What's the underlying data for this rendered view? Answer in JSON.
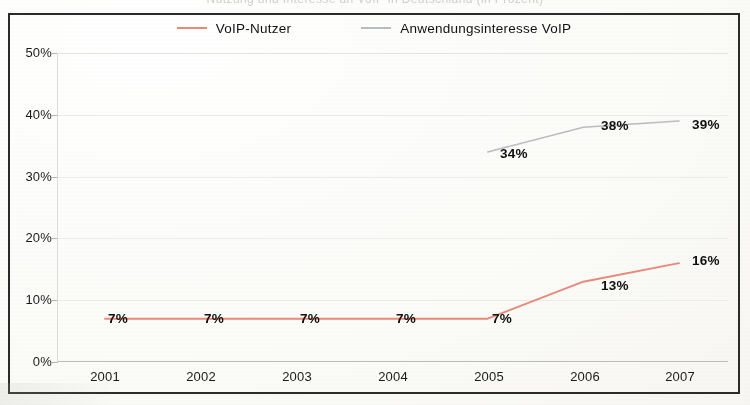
{
  "title_partial": "Nutzung und Interesse an VoIP in Deutschland (in Prozent)",
  "legend": {
    "items": [
      {
        "label": "VoIP-Nutzer",
        "color": "#e9897a"
      },
      {
        "label": "Anwendungsinteresse VoIP",
        "color": "#b9bcc0"
      }
    ]
  },
  "axes": {
    "y_ticks": [
      "0%",
      "10%",
      "20%",
      "30%",
      "40%",
      "50%"
    ],
    "x_ticks": [
      "2001",
      "2002",
      "2003",
      "2004",
      "2005",
      "2006",
      "2007"
    ]
  },
  "labels": {
    "voip_2001": "7%",
    "voip_2002": "7%",
    "voip_2003": "7%",
    "voip_2004": "7%",
    "voip_2005": "7%",
    "voip_2006": "13%",
    "voip_2007": "16%",
    "interest_2005": "34%",
    "interest_2006": "38%",
    "interest_2007": "39%"
  },
  "chart_data": {
    "type": "line",
    "title": "Nutzung und Interesse an VoIP in Deutschland (in Prozent)",
    "xlabel": "",
    "ylabel": "",
    "categories": [
      "2001",
      "2002",
      "2003",
      "2004",
      "2005",
      "2006",
      "2007"
    ],
    "series": [
      {
        "name": "VoIP-Nutzer",
        "color": "#e9897a",
        "values": [
          7,
          7,
          7,
          7,
          7,
          13,
          16
        ],
        "data_labels": [
          "7%",
          "7%",
          "7%",
          "7%",
          "7%",
          "13%",
          "16%"
        ]
      },
      {
        "name": "Anwendungsinteresse VoIP",
        "color": "#b9bcc0",
        "values": [
          null,
          null,
          null,
          null,
          34,
          38,
          39
        ],
        "data_labels": [
          null,
          null,
          null,
          null,
          "34%",
          "38%",
          "39%"
        ]
      }
    ],
    "ylim": [
      0,
      50
    ],
    "ytick_values": [
      0,
      10,
      20,
      30,
      40,
      50
    ],
    "ytick_labels": [
      "0%",
      "10%",
      "20%",
      "30%",
      "40%",
      "50%"
    ],
    "grid": {
      "horizontal": true,
      "vertical": false
    },
    "legend_position": "top-center",
    "units": "percent"
  }
}
